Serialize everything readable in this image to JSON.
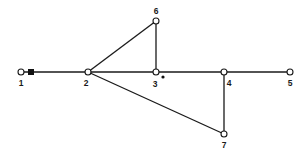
{
  "diagram": {
    "type": "graph",
    "nodes": [
      {
        "id": "1",
        "label": "1",
        "x": 21,
        "y": 72,
        "lx": 21,
        "ly": 86
      },
      {
        "id": "2",
        "label": "2",
        "x": 88,
        "y": 72,
        "lx": 86,
        "ly": 86
      },
      {
        "id": "3",
        "label": "3",
        "x": 156,
        "y": 72,
        "lx": 155,
        "ly": 87
      },
      {
        "id": "4",
        "label": "4",
        "x": 224,
        "y": 72,
        "lx": 229,
        "ly": 86
      },
      {
        "id": "5",
        "label": "5",
        "x": 290,
        "y": 72,
        "lx": 290,
        "ly": 86
      },
      {
        "id": "6",
        "label": "6",
        "x": 156,
        "y": 21,
        "lx": 156,
        "ly": 14
      },
      {
        "id": "7",
        "label": "7",
        "x": 224,
        "y": 134,
        "lx": 224,
        "ly": 148
      }
    ],
    "edges": [
      {
        "from": "1",
        "to": "2"
      },
      {
        "from": "2",
        "to": "3"
      },
      {
        "from": "3",
        "to": "4"
      },
      {
        "from": "4",
        "to": "5"
      },
      {
        "from": "2",
        "to": "6"
      },
      {
        "from": "6",
        "to": "3"
      },
      {
        "from": "2",
        "to": "7"
      },
      {
        "from": "7",
        "to": "4"
      }
    ],
    "markers": [
      {
        "type": "square",
        "x": 31,
        "y": 72,
        "note": "filled square near node 1 on edge 1-2"
      },
      {
        "type": "dot",
        "x": 163,
        "y": 77,
        "note": "small filled dot near node 3"
      }
    ]
  }
}
